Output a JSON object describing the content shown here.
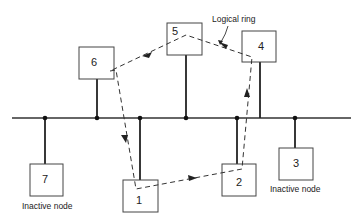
{
  "diagram": {
    "type": "token-bus logical ring",
    "ring_label": "Logical ring",
    "bus": {
      "x1": 12,
      "x2": 351,
      "y": 118
    },
    "nodes": [
      {
        "id": "6",
        "label": "6",
        "x": 79,
        "y": 47,
        "w": 35,
        "h": 32,
        "stem_x": 97,
        "side": "above",
        "active": true,
        "caption": ""
      },
      {
        "id": "5",
        "label": "5",
        "x": 167,
        "y": 23,
        "w": 35,
        "h": 32,
        "stem_x": 186,
        "side": "above",
        "active": true,
        "caption": ""
      },
      {
        "id": "4",
        "label": "4",
        "x": 242,
        "y": 31,
        "w": 34,
        "h": 31,
        "stem_x": 260,
        "side": "above",
        "active": true,
        "caption": ""
      },
      {
        "id": "7",
        "label": "7",
        "x": 30,
        "y": 164,
        "w": 33,
        "h": 32,
        "stem_x": 45,
        "side": "below",
        "active": false,
        "caption": "Inactive node"
      },
      {
        "id": "1",
        "label": "1",
        "x": 123,
        "y": 180,
        "w": 35,
        "h": 32,
        "stem_x": 140,
        "side": "below",
        "active": true,
        "caption": ""
      },
      {
        "id": "2",
        "label": "2",
        "x": 222,
        "y": 164,
        "w": 34,
        "h": 32,
        "stem_x": 237,
        "side": "below",
        "active": true,
        "caption": ""
      },
      {
        "id": "3",
        "label": "3",
        "x": 279,
        "y": 148,
        "w": 34,
        "h": 32,
        "stem_x": 295,
        "side": "below",
        "active": false,
        "caption": "Inactive node"
      }
    ],
    "ring_order": [
      "1",
      "2",
      "4",
      "5",
      "6",
      "1"
    ],
    "captions": {
      "node7": "Inactive node",
      "node3": "Inactive node"
    }
  }
}
